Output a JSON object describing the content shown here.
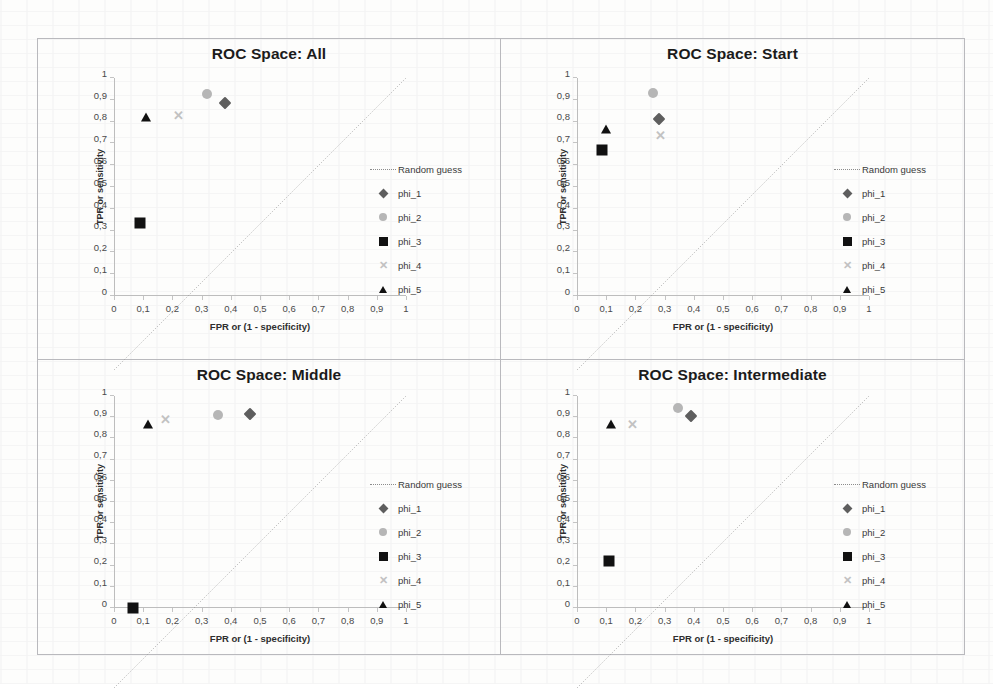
{
  "figure": {
    "axis_titles": {
      "x": "FPR or (1 - specificity)",
      "y": "TPR or sensitivity"
    },
    "tick_labels_x": [
      "0",
      "0,1",
      "0,2",
      "0,3",
      "0,4",
      "0,5",
      "0,6",
      "0,7",
      "0,8",
      "0,9",
      "1"
    ],
    "tick_labels_y": [
      "0",
      "0,1",
      "0,2",
      "0,3",
      "0,4",
      "0,5",
      "0,6",
      "0,7",
      "0,8",
      "0,9",
      "1"
    ],
    "legend_entries": [
      {
        "label": "Random guess",
        "key": "dotted-line-icon"
      },
      {
        "label": "phi_1",
        "key": "diamond-marker-icon"
      },
      {
        "label": "phi_2",
        "key": "circle-marker-icon"
      },
      {
        "label": "phi_3",
        "key": "square-marker-icon"
      },
      {
        "label": "phi_4",
        "key": "x-marker-icon"
      },
      {
        "label": "phi_5",
        "key": "triangle-marker-icon"
      }
    ],
    "marker_glyph_x": "✕",
    "colors": {
      "phi_1": "#5e5e5e",
      "phi_2": "#b6b6b6",
      "phi_3": "#111111",
      "phi_4": "#c2c2c2",
      "phi_5": "#111111",
      "random_guess": "#8c8c8c",
      "axis": "#bdbdbd",
      "title": "#1b1b1b"
    }
  },
  "chart_data": [
    {
      "type": "scatter",
      "title": "ROC Space: All",
      "xlabel": "FPR or (1 - specificity)",
      "ylabel": "TPR or sensitivity",
      "xlim": [
        0,
        1
      ],
      "ylim": [
        0,
        1
      ],
      "grid": false,
      "legend_position": "right",
      "annotations": [
        "Random guess diagonal from (0,0) to (1,1)"
      ],
      "series": [
        {
          "name": "phi_1",
          "marker": "diamond",
          "points": [
            {
              "x": 0.38,
              "y": 0.885
            }
          ]
        },
        {
          "name": "phi_2",
          "marker": "circle",
          "points": [
            {
              "x": 0.32,
              "y": 0.925
            }
          ]
        },
        {
          "name": "phi_3",
          "marker": "square",
          "points": [
            {
              "x": 0.09,
              "y": 0.335
            }
          ]
        },
        {
          "name": "phi_4",
          "marker": "x",
          "points": [
            {
              "x": 0.22,
              "y": 0.825
            }
          ]
        },
        {
          "name": "phi_5",
          "marker": "triangle",
          "points": [
            {
              "x": 0.11,
              "y": 0.82
            }
          ]
        }
      ]
    },
    {
      "type": "scatter",
      "title": "ROC Space: Start",
      "xlabel": "FPR or (1 - specificity)",
      "ylabel": "TPR or sensitivity",
      "xlim": [
        0,
        1
      ],
      "ylim": [
        0,
        1
      ],
      "grid": false,
      "legend_position": "right",
      "annotations": [
        "Random guess diagonal from (0,0) to (1,1)"
      ],
      "series": [
        {
          "name": "phi_1",
          "marker": "diamond",
          "points": [
            {
              "x": 0.28,
              "y": 0.81
            }
          ]
        },
        {
          "name": "phi_2",
          "marker": "circle",
          "points": [
            {
              "x": 0.26,
              "y": 0.93
            }
          ]
        },
        {
          "name": "phi_3",
          "marker": "square",
          "points": [
            {
              "x": 0.085,
              "y": 0.67
            }
          ]
        },
        {
          "name": "phi_4",
          "marker": "x",
          "points": [
            {
              "x": 0.285,
              "y": 0.735
            }
          ]
        },
        {
          "name": "phi_5",
          "marker": "triangle",
          "points": [
            {
              "x": 0.1,
              "y": 0.765
            }
          ]
        }
      ]
    },
    {
      "type": "scatter",
      "title": "ROC Space: Middle",
      "xlabel": "FPR or (1 - specificity)",
      "ylabel": "TPR or sensitivity",
      "xlim": [
        0,
        1
      ],
      "ylim": [
        0,
        1
      ],
      "grid": false,
      "legend_position": "right",
      "annotations": [
        "Random guess diagonal from (0,0) to (1,1)"
      ],
      "series": [
        {
          "name": "phi_1",
          "marker": "diamond",
          "points": [
            {
              "x": 0.465,
              "y": 0.915
            }
          ]
        },
        {
          "name": "phi_2",
          "marker": "circle",
          "points": [
            {
              "x": 0.355,
              "y": 0.91
            }
          ]
        },
        {
          "name": "phi_3",
          "marker": "square",
          "points": [
            {
              "x": 0.065,
              "y": 0.0
            }
          ]
        },
        {
          "name": "phi_4",
          "marker": "x",
          "points": [
            {
              "x": 0.175,
              "y": 0.885
            }
          ]
        },
        {
          "name": "phi_5",
          "marker": "triangle",
          "points": [
            {
              "x": 0.115,
              "y": 0.87
            }
          ]
        }
      ]
    },
    {
      "type": "scatter",
      "title": "ROC Space: Intermediate",
      "xlabel": "FPR or (1 - specificity)",
      "ylabel": "TPR or sensitivity",
      "xlim": [
        0,
        1
      ],
      "ylim": [
        0,
        1
      ],
      "grid": false,
      "legend_position": "right",
      "annotations": [
        "Random guess diagonal from (0,0) to (1,1)"
      ],
      "series": [
        {
          "name": "phi_1",
          "marker": "diamond",
          "points": [
            {
              "x": 0.39,
              "y": 0.905
            }
          ]
        },
        {
          "name": "phi_2",
          "marker": "circle",
          "points": [
            {
              "x": 0.345,
              "y": 0.945
            }
          ]
        },
        {
          "name": "phi_3",
          "marker": "square",
          "points": [
            {
              "x": 0.11,
              "y": 0.22
            }
          ]
        },
        {
          "name": "phi_4",
          "marker": "x",
          "points": [
            {
              "x": 0.19,
              "y": 0.865
            }
          ]
        },
        {
          "name": "phi_5",
          "marker": "triangle",
          "points": [
            {
              "x": 0.115,
              "y": 0.87
            }
          ]
        }
      ]
    }
  ]
}
